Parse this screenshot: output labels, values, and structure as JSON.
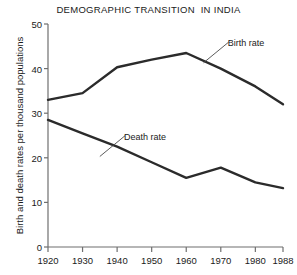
{
  "chart_data": {
    "type": "line",
    "title": "DEMOGRAPHIC TRANSITION  IN INDIA",
    "xlabel": "",
    "ylabel": "Birth and death rates per thousand populations",
    "x": [
      1920,
      1930,
      1940,
      1950,
      1960,
      1970,
      1980,
      1988
    ],
    "xtick_labels": [
      "1920",
      "1930",
      "1940",
      "1950",
      "1960",
      "1970",
      "1980",
      "1988"
    ],
    "ytick_labels": [
      "0",
      "10",
      "20",
      "30",
      "40",
      "50"
    ],
    "yticks": [
      0,
      10,
      20,
      30,
      40,
      50
    ],
    "xlim": [
      1920,
      1988
    ],
    "ylim": [
      0,
      50
    ],
    "grid": false,
    "legend": "inline-annotations",
    "series": [
      {
        "name": "Birth rate",
        "values": [
          33.0,
          34.5,
          40.3,
          42.0,
          43.5,
          40.0,
          36.0,
          32.0
        ],
        "color": "#2b2b2b",
        "style": "solid"
      },
      {
        "name": "Death rate",
        "values": [
          28.5,
          25.5,
          22.5,
          19.0,
          15.5,
          17.8,
          14.5,
          13.2
        ],
        "color": "#2b2b2b",
        "style": "solid"
      }
    ],
    "annotations": [
      {
        "text": "Birth rate",
        "series": "Birth rate",
        "x_label": 1972,
        "y_label": 45.5
      },
      {
        "text": "Death rate",
        "series": "Death rate",
        "x_label": 1942,
        "y_label": 24.5
      }
    ]
  },
  "axis": {
    "line_color": "#6f6f6f",
    "text_color": "#1a1a1a"
  }
}
